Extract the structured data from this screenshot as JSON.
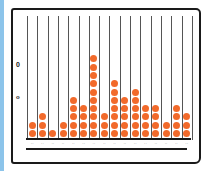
{
  "chart_data": {
    "type": "bar",
    "style": "dot plot (stacked dots per column)",
    "title": "",
    "xlabel": "",
    "ylabel": "",
    "categories": [
      "1",
      "2",
      "3",
      "4",
      "5",
      "6",
      "7",
      "8",
      "9",
      "10",
      "11",
      "12",
      "13",
      "14",
      "15",
      "16"
    ],
    "values": [
      2,
      3,
      1,
      2,
      5,
      4,
      10,
      3,
      7,
      5,
      6,
      4,
      4,
      2,
      4,
      3
    ],
    "y_marks": [
      "0",
      "o"
    ],
    "tick_labels_legible": false,
    "grid": true,
    "dot_color": "#f26a2b"
  },
  "colors": {
    "dot": "#f26a2b",
    "frame": "#1a1a1a",
    "grid": "#555555",
    "left_edge": "#8cc4ea"
  },
  "y_marks": {
    "upper": "0",
    "lower": "o"
  },
  "tick_labels": [
    "··",
    "··",
    "··",
    "··",
    "··",
    "··",
    "··",
    "··",
    "··",
    "··",
    "··",
    "··",
    "··",
    "··",
    "··",
    "··"
  ]
}
